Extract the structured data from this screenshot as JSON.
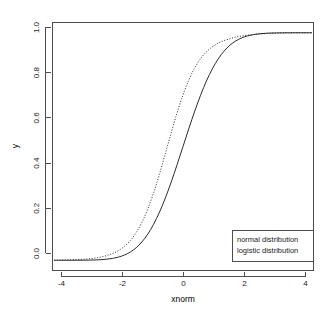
{
  "chart_data": {
    "type": "line",
    "title": "",
    "xlabel": "xnorm",
    "ylabel": "y",
    "xlim": [
      -4.45,
      4.45
    ],
    "ylim": [
      -0.045,
      1.045
    ],
    "grid": false,
    "legend_position": "bottom-right",
    "xticks": [
      "-4",
      "-2",
      "0",
      "2",
      "4"
    ],
    "xtick_values": [
      -4,
      -2,
      0,
      2,
      4
    ],
    "yticks": [
      "0.0",
      "0.2",
      "0.4",
      "0.6",
      "0.8",
      "1.0"
    ],
    "ytick_values": [
      0.0,
      0.2,
      0.4,
      0.6,
      0.8,
      1.0
    ],
    "series": [
      {
        "name": "normal distribution",
        "style": "solid",
        "color": "#2b2b2b",
        "x": [
          -4.4,
          -4.2,
          -4.0,
          -3.8,
          -3.6,
          -3.4,
          -3.2,
          -3.0,
          -2.8,
          -2.6,
          -2.4,
          -2.2,
          -2.0,
          -1.8,
          -1.6,
          -1.4,
          -1.2,
          -1.0,
          -0.8,
          -0.6,
          -0.4,
          -0.2,
          0.0,
          0.2,
          0.4,
          0.6,
          0.8,
          1.0,
          1.2,
          1.4,
          1.6,
          1.8,
          2.0,
          2.2,
          2.4,
          2.6,
          2.8,
          3.0,
          3.2,
          3.4,
          3.6,
          3.8,
          4.0,
          4.2,
          4.4
        ],
        "y": [
          0.0,
          0.0,
          0.0,
          0.0001,
          0.0002,
          0.0003,
          0.0007,
          0.0013,
          0.0026,
          0.0047,
          0.0082,
          0.0139,
          0.0228,
          0.0359,
          0.0548,
          0.0808,
          0.1151,
          0.1587,
          0.2119,
          0.2743,
          0.3446,
          0.4207,
          0.5,
          0.5793,
          0.6554,
          0.7257,
          0.7881,
          0.8413,
          0.8849,
          0.9192,
          0.9452,
          0.9641,
          0.9772,
          0.9861,
          0.9918,
          0.9953,
          0.9974,
          0.9987,
          0.9993,
          0.9997,
          0.9998,
          0.9999,
          1.0,
          1.0,
          1.0
        ]
      },
      {
        "name": "logistic distribution",
        "style": "dotted",
        "color": "#2b2b2b",
        "x": [
          -4.4,
          -4.2,
          -4.0,
          -3.8,
          -3.6,
          -3.4,
          -3.2,
          -3.0,
          -2.8,
          -2.6,
          -2.4,
          -2.2,
          -2.0,
          -1.8,
          -1.6,
          -1.4,
          -1.2,
          -1.0,
          -0.8,
          -0.6,
          -0.4,
          -0.2,
          0.0,
          0.2,
          0.4,
          0.6,
          0.8,
          1.0,
          1.2,
          1.4,
          1.6,
          1.8,
          2.0,
          2.2,
          2.4,
          2.6,
          2.8,
          3.0,
          3.2,
          3.4,
          3.6,
          3.8,
          4.0,
          4.2,
          4.4
        ],
        "y": [
          0.0007,
          0.001,
          0.0015,
          0.0022,
          0.0032,
          0.0046,
          0.0067,
          0.0098,
          0.0142,
          0.0205,
          0.0296,
          0.0425,
          0.0608,
          0.0862,
          0.1209,
          0.167,
          0.2257,
          0.2973,
          0.3798,
          0.4696,
          0.5613,
          0.6487,
          0.7269,
          0.7928,
          0.8456,
          0.8861,
          0.9163,
          0.9384,
          0.9542,
          0.9655,
          0.9735,
          0.9811,
          0.9855,
          0.9893,
          0.9922,
          0.9944,
          0.996,
          0.9971,
          0.9979,
          0.9985,
          0.9989,
          0.9992,
          0.9994,
          0.9996,
          0.9997
        ]
      }
    ],
    "legend": {
      "entries": [
        "normal distribution",
        "logistic distribution"
      ]
    }
  },
  "axes": {
    "x_title": "xnorm",
    "y_title": "y",
    "x_tick_labels": [
      "-4",
      "-2",
      "0",
      "2",
      "4"
    ],
    "y_tick_labels": [
      "0.0",
      "0.2",
      "0.4",
      "0.6",
      "0.8",
      "1.0"
    ]
  },
  "legend": {
    "entry_1": "normal distribution",
    "entry_2": "logistic distribution"
  },
  "colors": {
    "background": "#ffffff",
    "axis": "#4d4d4d",
    "curve": "#2b2b2b",
    "text": "#1a1a1a"
  }
}
